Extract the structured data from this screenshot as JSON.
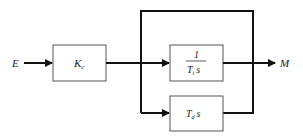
{
  "diagram": {
    "type": "block-diagram",
    "input_label": "E",
    "output_label": "M",
    "blocks": [
      {
        "id": "gain",
        "label": "K",
        "subscript": "c"
      },
      {
        "id": "integral",
        "numerator": "1",
        "denominator_main": "T",
        "denominator_sub": "i",
        "denominator_tail": "s"
      },
      {
        "id": "derivative",
        "label_main": "T",
        "label_sub": "d",
        "label_tail": "s"
      }
    ],
    "colors": {
      "line": "#111111",
      "box_border": "#555555",
      "text": "#222222"
    }
  }
}
